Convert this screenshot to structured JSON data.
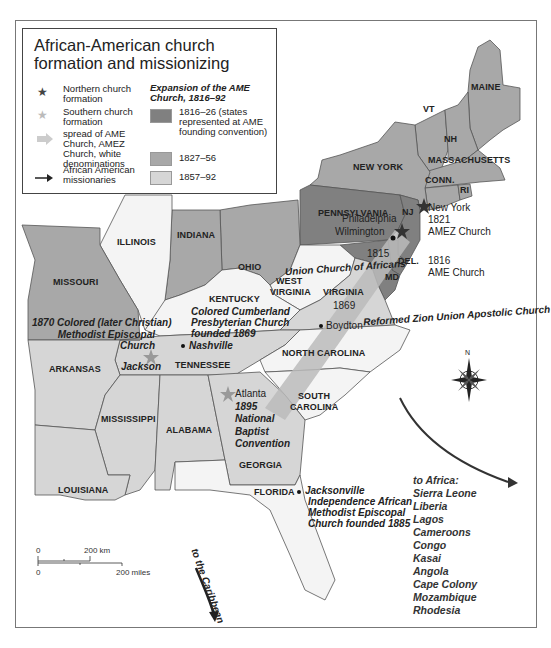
{
  "title": "African-American church formation and missionizing",
  "legend": {
    "symbols": [
      {
        "icon": "dark-star-icon",
        "label": "Northern church formation"
      },
      {
        "icon": "light-star-icon",
        "label": "Southern church formation"
      },
      {
        "icon": "broad-arrow-icon",
        "label": "spread of AME Church, AMEZ Church, white denominations"
      },
      {
        "icon": "thin-arrow-icon",
        "label": "African American missionaries"
      }
    ],
    "expansion_heading": "Expansion of the AME Church, 1816–92",
    "expansion_periods": [
      {
        "label": "1816–26 (states represented at AME founding convention)",
        "color": "#808080"
      },
      {
        "label": "1827–56",
        "color": "#a8a8a8"
      },
      {
        "label": "1857–92",
        "color": "#d6d6d6"
      }
    ]
  },
  "states": {
    "maine": "MAINE",
    "vt": "VT",
    "nh": "NH",
    "massachusetts": "MASSACHUSETTS",
    "conn": "CONN.",
    "ri": "RI",
    "new_york": "NEW YORK",
    "pennsylvania": "PENNSYLVANIA",
    "nj": "NJ",
    "del": "DEL.",
    "md": "MD",
    "illinois": "ILLINOIS",
    "indiana": "INDIANA",
    "ohio": "OHIO",
    "missouri": "MISSOURI",
    "kentucky": "KENTUCKY",
    "west_virginia_1": "WEST",
    "west_virginia_2": "VIRGINIA",
    "virginia": "VIRGINIA",
    "tennessee": "TENNESSEE",
    "north_carolina": "NORTH CAROLINA",
    "arkansas": "ARKANSAS",
    "south_carolina_1": "SOUTH",
    "south_carolina_2": "CAROLINA",
    "mississippi": "MISSISSIPPI",
    "alabama": "ALABAMA",
    "georgia": "GEORGIA",
    "louisiana": "LOUISIANA",
    "florida": "FLORIDA"
  },
  "annotations": {
    "new_york": [
      "New York",
      "1821",
      "AMEZ Church"
    ],
    "philadelphia": "Philadelphia",
    "wilmington": "Wilmington",
    "ame_1816": [
      "1816",
      "AME Church"
    ],
    "union_church": [
      "1815",
      "Union Church of Africans"
    ],
    "boydton": [
      "1869",
      "Boydton",
      "Reformed Zion Union Apostolic Church"
    ],
    "colored_cme": [
      "1870 Colored (later Christian)",
      "Methodist Episcopal",
      "Church"
    ],
    "jackson": "Jackson",
    "cumberland": [
      "Colored Cumberland",
      "Presbyterian Church",
      "founded 1869"
    ],
    "nashville": "Nashville",
    "atlanta": [
      "Atlanta",
      "1895",
      "National",
      "Baptist",
      "Convention"
    ],
    "jacksonville": [
      "Jacksonville",
      "Independence African",
      "Methodist Episcopal",
      "Church founded 1885"
    ],
    "caribbean": "to the Caribbean"
  },
  "africa": {
    "heading": "to Africa:",
    "destinations": [
      "Sierra Leone",
      "Liberia",
      "Lagos",
      "Cameroons",
      "Congo",
      "Kasai",
      "Angola",
      "Cape Colony",
      "Mozambique",
      "Rhodesia"
    ]
  },
  "scale_bar": {
    "km_zero": "0",
    "km_label": "200 km",
    "mi_zero": "0",
    "mi_label": "200 miles"
  },
  "compass": {
    "north_label": "N"
  },
  "colors": {
    "period1": "#808080",
    "period2": "#a8a8a8",
    "period3": "#d6d6d6",
    "unshaded": "#f4f4f4",
    "border": "#555555"
  }
}
